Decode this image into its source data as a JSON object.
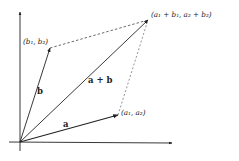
{
  "diagram": {
    "colors": {
      "ink": "#222222",
      "dashed": "#444444",
      "background": "#ffffff"
    },
    "axes": {
      "origin": [
        20,
        142
      ],
      "x_end": [
        172,
        143
      ],
      "y_end": [
        20,
        12
      ]
    },
    "vectors": [
      {
        "id": "a",
        "label": "a",
        "tip": [
          118,
          115
        ],
        "tip_label": "(a₁, a₂)"
      },
      {
        "id": "b",
        "label": "b",
        "tip": [
          50,
          48
        ],
        "tip_label": "(b₁, b₂)"
      },
      {
        "id": "sum",
        "label": "a + b",
        "tip": [
          148,
          20
        ],
        "tip_label": "(a₁ + b₁, a₂ + b₂)"
      }
    ],
    "dashed_edges": [
      {
        "from": "b",
        "to": "sum"
      },
      {
        "from": "a",
        "to": "sum"
      }
    ]
  }
}
